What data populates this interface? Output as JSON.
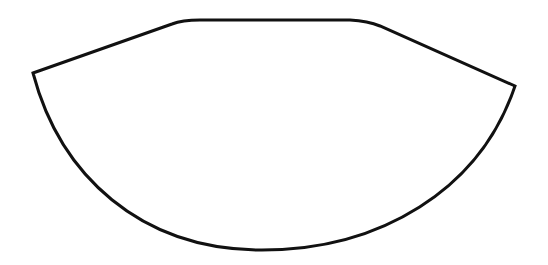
{
  "diagram": {
    "shape": "bowl-outline",
    "stroke_color": "#111111",
    "fill_color": "#ffffff",
    "background_color": "#ffffff",
    "stroke_width": 3,
    "points": {
      "left_corner": [
        33,
        73
      ],
      "top_left_bend": [
        180,
        22
      ],
      "top_right_bend": [
        370,
        24
      ],
      "right_corner": [
        515,
        86
      ],
      "bottom": [
        258,
        250
      ]
    }
  }
}
